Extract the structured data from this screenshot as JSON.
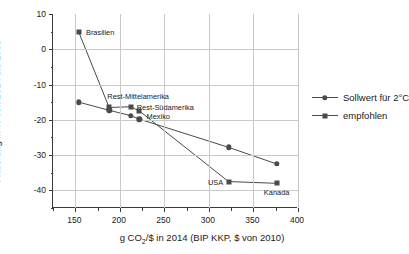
{
  "chart_data": {
    "type": "line",
    "title": "",
    "xlabel": "g CO2/$ in 2014 (BIP KKP, $ von 2010)",
    "ylabel": "Änderung in % von 2014 bis 2030",
    "xlim": [
      125,
      400
    ],
    "ylim": [
      -45,
      10
    ],
    "xticks": [
      150,
      200,
      250,
      300,
      350,
      400
    ],
    "yticks": [
      10,
      0,
      -10,
      -20,
      -30,
      -40
    ],
    "grid": true,
    "legend_position": "right",
    "series": [
      {
        "name": "Sollwert für 2°C",
        "marker": "circle",
        "points": [
          {
            "x": 154,
            "y": -15.0,
            "label": ""
          },
          {
            "x": 188,
            "y": -17.3,
            "label": ""
          },
          {
            "x": 212,
            "y": -18.8,
            "label": ""
          },
          {
            "x": 222,
            "y": -19.8,
            "label": ""
          },
          {
            "x": 322,
            "y": -27.8,
            "label": ""
          },
          {
            "x": 376,
            "y": -32.5,
            "label": ""
          }
        ]
      },
      {
        "name": "empfohlen",
        "marker": "square",
        "points": [
          {
            "x": 154,
            "y": 4.8,
            "label": "Brasilien"
          },
          {
            "x": 188,
            "y": -16.5,
            "label": "Rest-Mittelamerika"
          },
          {
            "x": 212,
            "y": -16.3,
            "label": "Rest-Südamerika"
          },
          {
            "x": 222,
            "y": -17.5,
            "label": "Mexiko"
          },
          {
            "x": 322,
            "y": -37.5,
            "label": "USA"
          },
          {
            "x": 376,
            "y": -38.0,
            "label": "Kanada"
          }
        ]
      }
    ],
    "annotations": [
      {
        "text": "Brasilien",
        "x": 162,
        "y": 4.8,
        "anchor": "left"
      },
      {
        "text": "Rest-Mittelamerika",
        "x": 186,
        "y": -13.2,
        "anchor": "left"
      },
      {
        "text": "Rest-Südamerika",
        "x": 219,
        "y": -16.3,
        "anchor": "left"
      },
      {
        "text": "Mexiko",
        "x": 230,
        "y": -19.0,
        "anchor": "left"
      },
      {
        "text": "USA",
        "x": 316,
        "y": -37.5,
        "anchor": "right"
      },
      {
        "text": "Kanada",
        "x": 376,
        "y": -40.6,
        "anchor": "center"
      }
    ],
    "colors": {
      "marker": "#4a4a4a",
      "line": "#4a4a4a",
      "grid": "#c9c9c9",
      "axis": "#3a3a3a",
      "background": "#ffffff"
    }
  },
  "axis_labels": {
    "y_title": "Änderung in % von 2014 bis 2030",
    "x_title_pre": "g CO",
    "x_title_sub": "2",
    "x_title_post": "/$ in 2014 (BIP KKP, $ von 2010)"
  },
  "legend": {
    "items": [
      {
        "label": "Sollwert für 2°C",
        "marker": "circle"
      },
      {
        "label": "empfohlen",
        "marker": "square"
      }
    ]
  }
}
